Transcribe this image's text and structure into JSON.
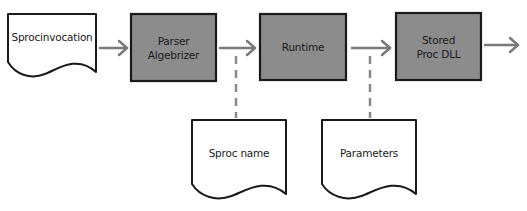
{
  "diagram": {
    "colors": {
      "stroke": "#1a1a1a",
      "process_fill": "#8c8c8c",
      "document_fill": "#ffffff",
      "arrow": "#7a7a7a",
      "dashed": "#8a8a8a",
      "background": "#ffffff"
    },
    "nodes": [
      {
        "id": "sproc-invocation",
        "shape": "document",
        "label": "Sprocinvocation",
        "x": 8,
        "y": 14,
        "w": 88,
        "h": 62
      },
      {
        "id": "parser-algebrizer",
        "shape": "process",
        "label": "Parser\nAlgebrizer",
        "x": 131,
        "y": 14,
        "w": 85,
        "h": 67
      },
      {
        "id": "runtime",
        "shape": "process",
        "label": "Runtime",
        "x": 260,
        "y": 14,
        "w": 86,
        "h": 66
      },
      {
        "id": "stored-proc-dll",
        "shape": "process",
        "label": "Stored\nProc DLL",
        "x": 396,
        "y": 13,
        "w": 85,
        "h": 67
      },
      {
        "id": "sproc-name",
        "shape": "document",
        "label": "Sproc name",
        "x": 192,
        "y": 120,
        "w": 94,
        "h": 78
      },
      {
        "id": "parameters",
        "shape": "document",
        "label": "Parameters",
        "x": 322,
        "y": 120,
        "w": 94,
        "h": 78
      }
    ],
    "edges": [
      {
        "from": "sproc-invocation",
        "to": "parser-algebrizer",
        "style": "arrow",
        "x1": 100,
        "y1": 48,
        "x2": 127,
        "y2": 48
      },
      {
        "from": "parser-algebrizer",
        "to": "runtime",
        "style": "arrow",
        "x1": 220,
        "y1": 48,
        "x2": 255,
        "y2": 48
      },
      {
        "from": "runtime",
        "to": "stored-proc-dll",
        "style": "arrow",
        "x1": 352,
        "y1": 48,
        "x2": 390,
        "y2": 48
      },
      {
        "from": "stored-proc-dll",
        "to": "output",
        "style": "arrow",
        "x1": 485,
        "y1": 45,
        "x2": 518,
        "y2": 45
      },
      {
        "from": "sproc-name",
        "to": "parser-runtime-link",
        "style": "dashed",
        "x1": 236,
        "y1": 56,
        "x2": 236,
        "y2": 118
      },
      {
        "from": "parameters",
        "to": "runtime-dll-link",
        "style": "dashed",
        "x1": 370,
        "y1": 56,
        "x2": 370,
        "y2": 118
      }
    ]
  }
}
